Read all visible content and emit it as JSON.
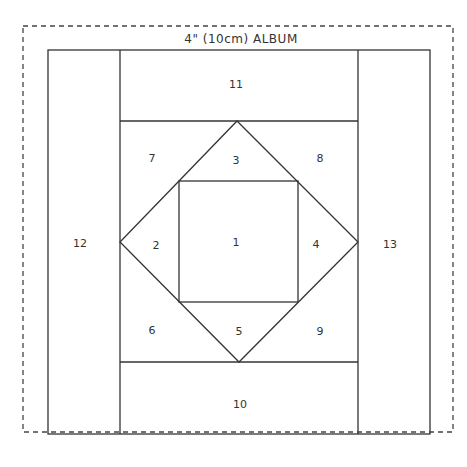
{
  "title": "4\" (10cm)  ALBUM",
  "colors": {
    "line": "#333333",
    "background": "#ffffff"
  },
  "pieces": [
    {
      "id": "1",
      "label": "1",
      "x": 236,
      "y": 242
    },
    {
      "id": "2",
      "label": "2",
      "x": 156,
      "y": 245
    },
    {
      "id": "3",
      "label": "3",
      "x": 236,
      "y": 160
    },
    {
      "id": "4",
      "label": "4",
      "x": 316,
      "y": 244
    },
    {
      "id": "5",
      "label": "5",
      "x": 239,
      "y": 331
    },
    {
      "id": "6",
      "label": "6",
      "x": 152,
      "y": 330
    },
    {
      "id": "7",
      "label": "7",
      "x": 152,
      "y": 158
    },
    {
      "id": "8",
      "label": "8",
      "x": 320,
      "y": 158
    },
    {
      "id": "9",
      "label": "9",
      "x": 320,
      "y": 331
    },
    {
      "id": "10",
      "label": "10",
      "x": 240,
      "y": 404
    },
    {
      "id": "11",
      "label": "11",
      "x": 236,
      "y": 84
    },
    {
      "id": "12",
      "label": "12",
      "x": 80,
      "y": 243
    },
    {
      "id": "13",
      "label": "13",
      "x": 390,
      "y": 244
    }
  ]
}
